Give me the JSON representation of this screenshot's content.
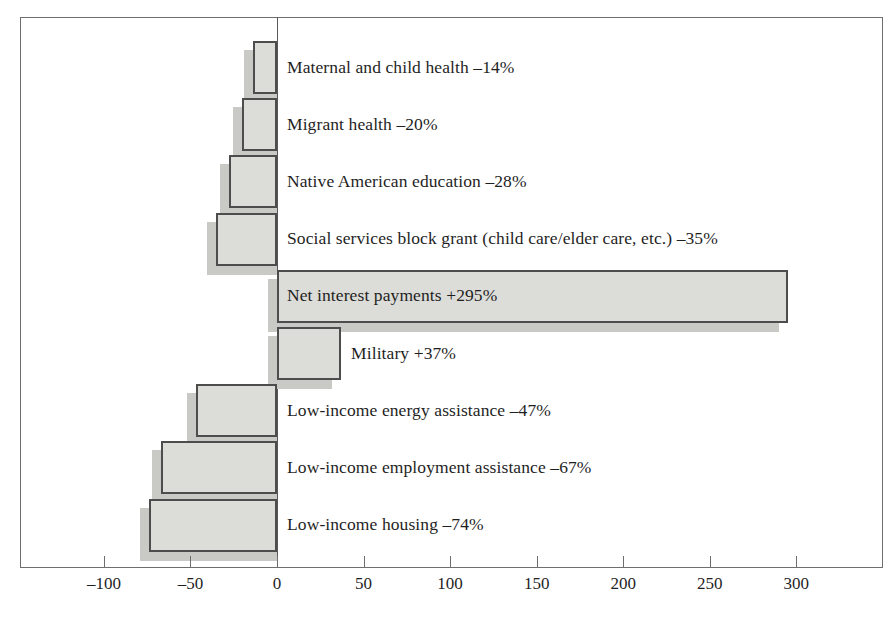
{
  "chart_data": {
    "type": "bar",
    "orientation": "horizontal",
    "title": "",
    "subtitle": "",
    "xlabel": "",
    "ylabel": "",
    "xlim": [
      -130,
      350
    ],
    "grid": false,
    "legend": null,
    "value_unit": "percent",
    "zero_reference": 0,
    "xticks": [
      -100,
      -50,
      0,
      50,
      100,
      150,
      200,
      250,
      300
    ],
    "xticklabels": [
      "–100",
      "–50",
      "0",
      "50",
      "100",
      "150",
      "200",
      "250",
      "300"
    ],
    "categories": [
      "Maternal and child health",
      "Migrant health",
      "Native American education",
      "Social services block grant (child care/elder care, etc.)",
      "Net interest payments",
      "Military",
      "Low-income energy assistance",
      "Low-income employment assistance",
      "Low-income housing"
    ],
    "values": [
      -14,
      -20,
      -28,
      -35,
      295,
      37,
      -47,
      -67,
      -74
    ],
    "datalabels": [
      "Maternal and child health –14%",
      "Migrant health –20%",
      "Native American education –28%",
      "Social services block grant (child care/elder care, etc.) –35%",
      "Net interest payments +295%",
      "Military +37%",
      "Low-income energy assistance –47%",
      "Low-income employment assistance –67%",
      "Low-income housing –74%"
    ],
    "colors": {
      "bar_fill": "#dcdcd8",
      "bar_border": "#4d4d4d",
      "bar_shadow": "#c9c9c6",
      "axis": "#6e6e6e",
      "text": "#1f1f1f",
      "background": "#ffffff"
    }
  }
}
